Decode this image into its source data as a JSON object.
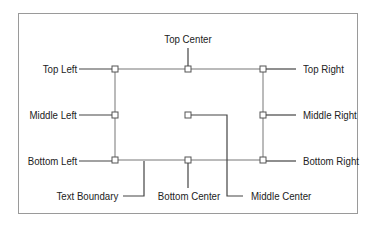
{
  "diagram": {
    "labels": {
      "top_left": "Top Left",
      "top_center": "Top Center",
      "top_right": "Top Right",
      "middle_left": "Middle Left",
      "middle_center": "Middle Center",
      "middle_right": "Middle Right",
      "bottom_left": "Bottom Left",
      "bottom_center": "Bottom Center",
      "bottom_right": "Bottom Right",
      "text_boundary": "Text Boundary"
    },
    "colors": {
      "line": "#444444",
      "box": "#777777",
      "frame": "#9a9a9a",
      "text": "#222222"
    }
  }
}
